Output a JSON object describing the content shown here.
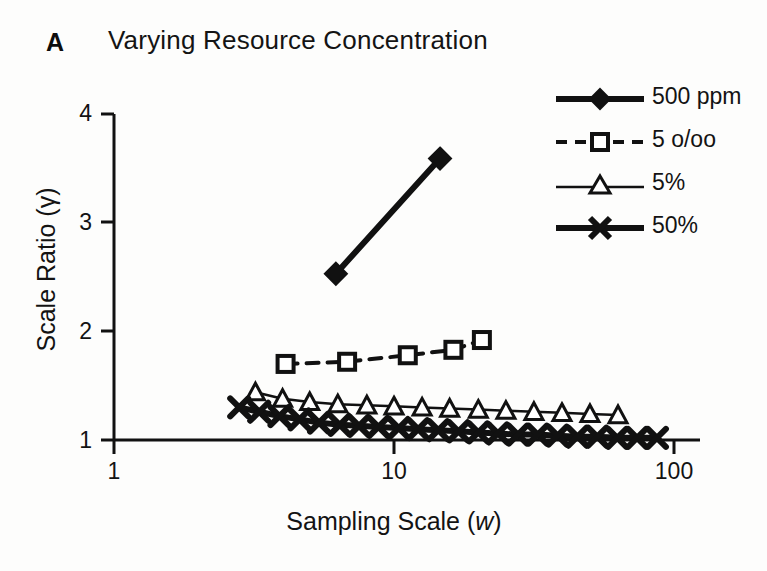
{
  "panel": {
    "label": "A",
    "title": "Varying Resource Concentration"
  },
  "axes": {
    "x": {
      "label_text": "Sampling Scale (",
      "label_italic": "w",
      "label_close": ")",
      "scale": "log",
      "ticks": [
        "1",
        "10",
        "100"
      ],
      "tick_values": [
        1,
        10,
        100
      ],
      "range": [
        1,
        100
      ]
    },
    "y": {
      "label_text": "Scale Ratio (γ)",
      "scale": "linear",
      "ticks": [
        "1",
        "2",
        "3",
        "4"
      ],
      "tick_values": [
        1,
        2,
        3,
        4
      ],
      "range": [
        1,
        4
      ]
    }
  },
  "legend": {
    "position": "top-right",
    "entries": [
      {
        "label": "500 ppm",
        "marker": "filled-diamond",
        "line": "solid-thick",
        "color": "#111111"
      },
      {
        "label": "5 o/oo",
        "marker": "open-square",
        "line": "dashed",
        "color": "#111111"
      },
      {
        "label": "5%",
        "marker": "open-triangle",
        "line": "solid-thin",
        "color": "#111111"
      },
      {
        "label": "50%",
        "marker": "x-cross",
        "line": "solid-thick",
        "color": "#111111"
      }
    ]
  },
  "chart_data": {
    "type": "line",
    "title": "Varying Resource Concentration",
    "xlabel": "Sampling Scale (w)",
    "ylabel": "Scale Ratio (γ)",
    "xscale": "log",
    "yscale": "linear",
    "xlim": [
      1,
      100
    ],
    "ylim": [
      1,
      4
    ],
    "grid": false,
    "legend_position": "top-right",
    "series": [
      {
        "name": "500 ppm",
        "marker": "filled-diamond",
        "line": "solid-thick",
        "color": "#111111",
        "x": [
          6.2,
          14.6
        ],
        "y": [
          2.53,
          3.59
        ]
      },
      {
        "name": "5 o/oo",
        "marker": "open-square",
        "line": "dashed",
        "color": "#111111",
        "x": [
          4.1,
          6.8,
          11.2,
          16.3,
          20.6
        ],
        "y": [
          1.7,
          1.72,
          1.78,
          1.83,
          1.92
        ]
      },
      {
        "name": "5%",
        "marker": "open-triangle",
        "line": "solid-thin",
        "color": "#111111",
        "x": [
          3.2,
          4.0,
          5.0,
          6.3,
          8.0,
          10.0,
          12.6,
          15.8,
          20.0,
          25.1,
          31.6,
          39.8,
          50.1,
          63.1
        ],
        "y": [
          1.44,
          1.38,
          1.35,
          1.33,
          1.32,
          1.31,
          1.3,
          1.29,
          1.28,
          1.27,
          1.26,
          1.25,
          1.24,
          1.23
        ]
      },
      {
        "name": "50%",
        "marker": "x-cross",
        "line": "solid-thick",
        "color": "#111111",
        "x": [
          2.8,
          3.3,
          3.9,
          4.6,
          5.4,
          6.4,
          7.5,
          8.8,
          10.4,
          12.2,
          14.4,
          17.0,
          20.0,
          23.5,
          27.7,
          32.6,
          38.4,
          45.2,
          53.2,
          62.7,
          73.8,
          86.9
        ],
        "y": [
          1.3,
          1.26,
          1.22,
          1.19,
          1.16,
          1.14,
          1.13,
          1.12,
          1.11,
          1.1,
          1.09,
          1.08,
          1.07,
          1.06,
          1.05,
          1.05,
          1.04,
          1.03,
          1.03,
          1.02,
          1.02,
          1.02
        ]
      }
    ]
  }
}
